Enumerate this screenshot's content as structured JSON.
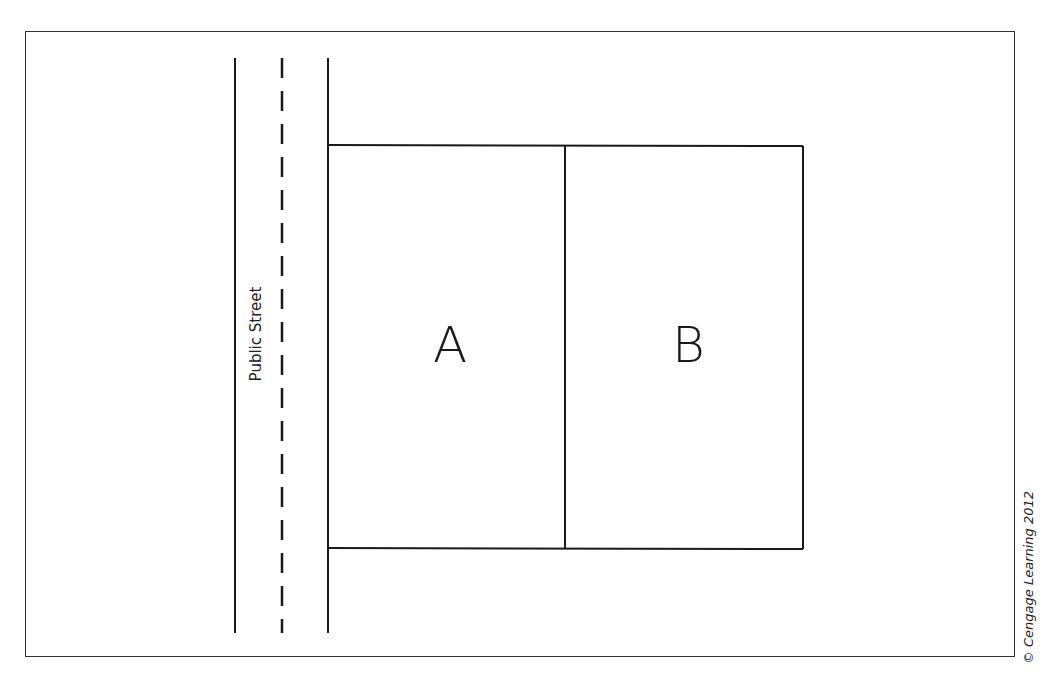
{
  "diagram": {
    "street": {
      "label": "Public Street",
      "left_curb_x": 235,
      "center_line_x": 282,
      "right_curb_x": 328,
      "top_y": 58,
      "bottom_y": 633,
      "center_line_style": "dashed"
    },
    "lots": [
      {
        "id": "A",
        "label": "A",
        "adjacent_to_street": true
      },
      {
        "id": "B",
        "label": "B",
        "adjacent_to_street": false
      }
    ],
    "credit": "© Cengage Learning 2012",
    "colors": {
      "line": "#1a1a1a",
      "background": "#ffffff",
      "frame": "#333333"
    }
  }
}
